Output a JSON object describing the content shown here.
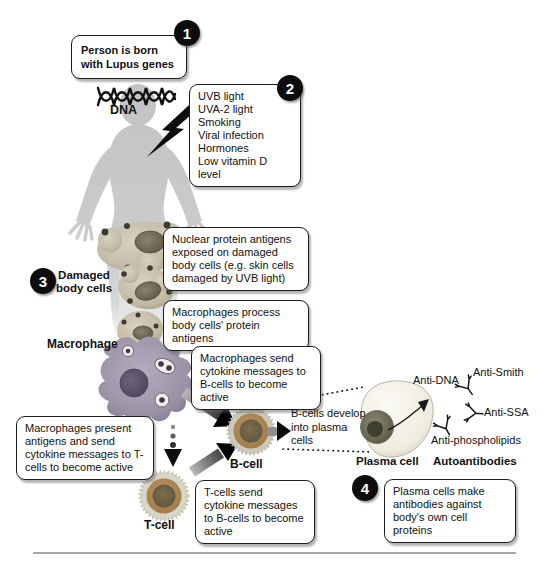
{
  "steps": {
    "step1": {
      "number": "1",
      "text": "Person is born with Lupus genes"
    },
    "step2": {
      "number": "2",
      "items": [
        "UVB light",
        "UVA-2 light",
        "Smoking",
        "Viral infection",
        "Hormones",
        "Low vitamin D level"
      ]
    },
    "step3": {
      "number": "3",
      "label": "Damaged body cells"
    },
    "step4": {
      "number": "4",
      "text": "Plasma cells make antibodies against body's own cell proteins"
    }
  },
  "callouts": {
    "nuclear_antigens": "Nuclear protein antigens exposed on damaged body cells (e.g. skin cells damaged by UVB light)",
    "macrophages_process": "Macrophages process body cells' protein antigens",
    "macrophages_send": "Macrophages send cytokine messages to B-cells to become active",
    "macrophages_present": "Macrophages present antigens and send cytokine messages to T-cells to become active",
    "tcells_send": "T-cells send cytokine messages to B-cells to become active",
    "bcells_develop": "B-cells develop into plasma cells"
  },
  "labels": {
    "dna": "DNA",
    "macrophage": "Macrophage",
    "b_cell": "B-cell",
    "t_cell": "T-cell",
    "plasma_cell": "Plasma cell",
    "autoantibodies": "Autoantibodies"
  },
  "antibodies": [
    "Anti-DNA",
    "Anti-Smith",
    "Anti-SSA",
    "Anti-phospholipids"
  ],
  "colors": {
    "box_border": "#1c1c1c",
    "badge_black": "#0d0d0d",
    "body_gray": "#c6c6c6",
    "damaged_cell_tan": "#cdc5b2",
    "macrophage_purple": "#9c93a6",
    "lymphocyte_orange": "#b08a52",
    "plasma_cream": "#f5f3ec"
  }
}
